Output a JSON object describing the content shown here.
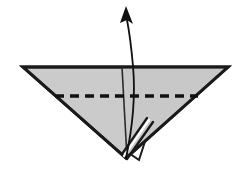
{
  "diagram": {
    "title": "Origami fold step: inverted triangle with valley fold and rotate arrow",
    "type": "origami-instruction",
    "canvas": {
      "width": 238,
      "height": 170,
      "background": "#ffffff"
    },
    "colors": {
      "paper_fill": "#cbcbcb",
      "paper_fill_shade": "#c4c4c4",
      "outline": "#1a1a1a",
      "crease_line": "#2b2b2b",
      "fold_line": "#111111",
      "arrow": "#111111",
      "under_layer": "#ffffff",
      "background": "#ffffff"
    },
    "shapes": {
      "main_triangle": {
        "name": "inverted-triangle-paper",
        "points": "23,67 228,67 126,158",
        "fill": "#cbcbcb",
        "stroke": "#1a1a1a",
        "stroke_width": 3
      },
      "under_flap": {
        "name": "under-layer-flap",
        "points": "126,151 150,126 139,160",
        "fill": "#ffffff",
        "stroke": "#1a1a1a",
        "stroke_width": 2
      }
    },
    "lines": {
      "vertical_crease": {
        "name": "vertical-center-crease",
        "x1": 122,
        "y1": 67,
        "x2": 127,
        "y2": 158,
        "stroke": "#2b2b2b",
        "stroke_width": 1.6,
        "style": "solid"
      },
      "valley_fold": {
        "name": "horizontal-valley-fold-line",
        "x1": 55,
        "y1": 96,
        "x2": 198,
        "y2": 96,
        "stroke": "#111111",
        "stroke_width": 3.4,
        "style": "dashed",
        "dash_length": 9,
        "dash_gap": 6
      }
    },
    "arrow": {
      "name": "fold-up-arrow",
      "path": "M126,158 C132,130 136,100 133,66 C131,44 129,30 127,20",
      "stroke": "#111111",
      "stroke_width": 1.8,
      "head": {
        "name": "arrowhead",
        "points": "126,6 133,24 127,20 120,23",
        "fill": "#111111"
      },
      "direction": "up",
      "meaning": "fold flap upward"
    },
    "labels": {
      "step_caption": "",
      "figure_number": ""
    }
  }
}
